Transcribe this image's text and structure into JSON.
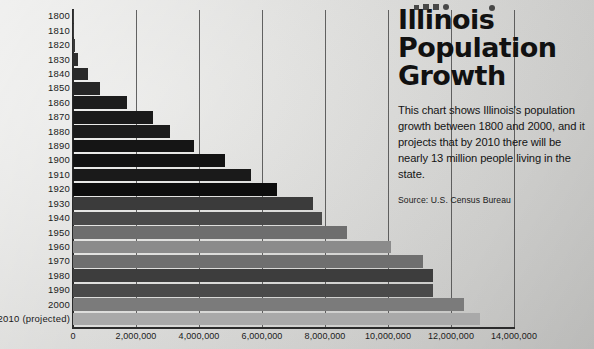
{
  "title": {
    "lines": [
      "Illinois",
      "Population",
      "Growth"
    ],
    "full": "Illinois Population Growth"
  },
  "description": "This chart shows Illinois's population growth between 1800 and 2000, and it projects that by 2010 there will be nearly 13 million people living in the state.",
  "source": "Source: U.S. Census Bureau",
  "colors": {
    "background": "#d9d9d7",
    "axis": "#2b2b2b",
    "gridline": "#4a4a4a",
    "text": "#111111"
  },
  "chart_data": {
    "type": "bar",
    "orientation": "horizontal",
    "xlabel": "",
    "ylabel": "",
    "xlim": [
      0,
      14000000
    ],
    "grid": true,
    "legend": null,
    "xticks": [
      0,
      2000000,
      4000000,
      6000000,
      8000000,
      10000000,
      12000000,
      14000000
    ],
    "xtick_labels": [
      "0",
      "2,000,000",
      "4,000,000",
      "6,000,000",
      "8,000,000",
      "10,000,000",
      "12,000,000",
      "14,000,000"
    ],
    "categories": [
      "1800",
      "1810",
      "1820",
      "1830",
      "1840",
      "1850",
      "1860",
      "1870",
      "1880",
      "1890",
      "1900",
      "1910",
      "1920",
      "1930",
      "1940",
      "1950",
      "1960",
      "1970",
      "1980",
      "1990",
      "2000",
      "2010 (projected)"
    ],
    "values": [
      2500,
      12282,
      55211,
      157445,
      476183,
      851470,
      1711951,
      2539891,
      3077871,
      3826352,
      4821550,
      5638591,
      6485280,
      7630654,
      7897241,
      8712176,
      10081158,
      11113976,
      11426518,
      11430602,
      12419293,
      12916894
    ],
    "bar_colors": [
      "#3a3a3a",
      "#3a3a3a",
      "#3a3a3a",
      "#2f2f2f",
      "#2a2a2a",
      "#262626",
      "#1d1d1d",
      "#1a1a1a",
      "#1c1c1c",
      "#151515",
      "#121212",
      "#1a1a1a",
      "#0d0d0d",
      "#3b3b3b",
      "#4a4a4a",
      "#6e6e6e",
      "#8b8b8b",
      "#6f6f6f",
      "#3d3d3d",
      "#4a4a4a",
      "#7b7b7b",
      "#a9a9a9"
    ]
  }
}
